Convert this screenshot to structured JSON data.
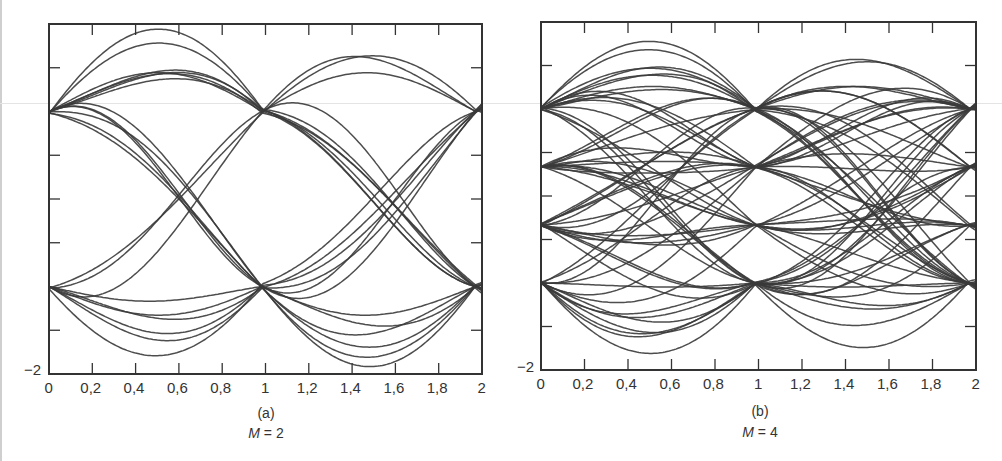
{
  "chart_data": [
    {
      "type": "line",
      "title": "Eye pattern",
      "panel_label": "(a)",
      "subtitle_var": "M",
      "subtitle_value": "2",
      "subtitle": "M = 2",
      "xlabel": "",
      "ylabel": "",
      "xlim": [
        0,
        2
      ],
      "ylim": [
        -2,
        2
      ],
      "x_ticks": [
        "0",
        "0,2",
        "0,4",
        "0,6",
        "0,8",
        "1",
        "1,2",
        "1,4",
        "1,6",
        "1,8",
        "2"
      ],
      "y_tick_labels": [
        "-2"
      ],
      "y_ticks": [
        -1.5,
        -0.5,
        0,
        0.5,
        1.5
      ],
      "levels": [
        -1,
        1
      ],
      "grid": false,
      "description": "Binary eye diagram: traces converge near ±1 at t≈0, 0.97, 1.97; eye opening centered around t≈0.5 and t≈1.5, peak excursions ≈ ±1.55"
    },
    {
      "type": "line",
      "title": "Eye pattern",
      "panel_label": "(b)",
      "subtitle_var": "M",
      "subtitle_value": "4",
      "subtitle": "M = 4",
      "xlabel": "",
      "ylabel": "",
      "xlim": [
        0,
        2
      ],
      "ylim": [
        -2,
        2
      ],
      "x_ticks": [
        "0",
        "0,2",
        "0,4",
        "0,6",
        "0,8",
        "1",
        "1,2",
        "1,4",
        "1,6",
        "1,8",
        "2"
      ],
      "y_tick_labels": [
        "-2"
      ],
      "y_ticks": [
        -1.5,
        -0.5,
        0,
        0.5,
        1.5
      ],
      "levels": [
        -1,
        -0.333,
        0.333,
        1
      ],
      "grid": false,
      "description": "4-level eye diagram: traces converge near ±1 and ±1/3 at t≈0, 0.97, 1.97; three stacked eye openings"
    }
  ],
  "panels": [
    {
      "caption": "(a)",
      "m_var": "M",
      "m_text": " = 2",
      "y_min_label": "−2",
      "x_ticks": [
        "0",
        "0,2",
        "0,4",
        "0,6",
        "0,8",
        "1",
        "1,2",
        "1,4",
        "1,6",
        "1,8",
        "2"
      ]
    },
    {
      "caption": "(b)",
      "m_var": "M",
      "m_text": " = 4",
      "y_min_label": "−2",
      "x_ticks": [
        "0",
        "0,2",
        "0,4",
        "0,6",
        "0,8",
        "1",
        "1,2",
        "1,4",
        "1,6",
        "1,8",
        "2"
      ]
    }
  ],
  "colors": {
    "trace": "#3a3a3a",
    "axis": "#333333",
    "background": "#ffffff"
  }
}
